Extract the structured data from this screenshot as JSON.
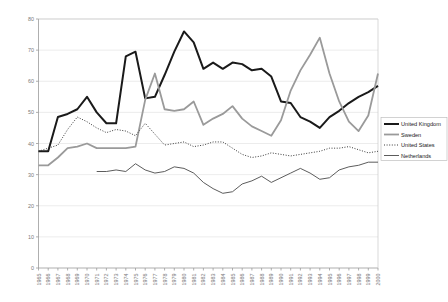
{
  "chart_data": {
    "type": "line",
    "title": "",
    "subtitle": "",
    "xlabel": "",
    "ylabel": "",
    "xlim": [
      1965,
      2000
    ],
    "ylim": [
      0,
      80
    ],
    "ytick_interval": 10,
    "grid": "horizontal",
    "legend_position": "right",
    "x": [
      1965,
      1966,
      1967,
      1968,
      1969,
      1970,
      1971,
      1972,
      1973,
      1974,
      1975,
      1976,
      1977,
      1978,
      1979,
      1980,
      1981,
      1982,
      1983,
      1984,
      1985,
      1986,
      1987,
      1988,
      1989,
      1990,
      1991,
      1992,
      1993,
      1994,
      1995,
      1996,
      1997,
      1998,
      1999,
      2000
    ],
    "yticks": [
      0,
      10,
      20,
      30,
      40,
      50,
      60,
      70,
      80
    ],
    "xtick_labels": [
      "1965",
      "1966",
      "1967",
      "1968",
      "1969",
      "1970",
      "1971",
      "1972",
      "1973",
      "1974",
      "1975",
      "1976",
      "1977",
      "1978",
      "1979",
      "1980",
      "1981",
      "1982",
      "1983",
      "1984",
      "1985",
      "1986",
      "1987",
      "1988",
      "1989",
      "1990",
      "1991",
      "1992",
      "1993",
      "1994",
      "1995",
      "1996",
      "1997",
      "1998",
      "1999",
      "2000"
    ],
    "series": [
      {
        "name": "United Kingdom",
        "color": "#1a1a1a",
        "width": 2.0,
        "dash": "none",
        "values": [
          37.5,
          37.5,
          48.5,
          49.5,
          51.0,
          55.0,
          50.0,
          46.5,
          46.5,
          68.0,
          69.5,
          54.5,
          55.0,
          62.0,
          69.5,
          76.0,
          72.5,
          64.0,
          66.0,
          64.0,
          66.0,
          65.5,
          63.5,
          64.0,
          61.5,
          53.5,
          53.0,
          48.5,
          47.0,
          45.0,
          48.5,
          50.5,
          53.0,
          55.0,
          56.5,
          58.5
        ]
      },
      {
        "name": "Sweden",
        "color": "#9a9a9a",
        "width": 1.8,
        "dash": "none",
        "values": [
          33.0,
          33.0,
          35.5,
          38.5,
          39.0,
          40.0,
          38.5,
          38.5,
          38.5,
          38.5,
          39.0,
          54.0,
          62.5,
          51.0,
          50.5,
          51.0,
          53.5,
          46.0,
          48.0,
          49.5,
          52.0,
          48.0,
          45.5,
          44.0,
          42.5,
          47.5,
          57.0,
          63.5,
          68.5,
          74.0,
          62.5,
          53.5,
          47.0,
          44.0,
          49.0,
          62.5
        ]
      },
      {
        "name": "United States",
        "color": "#3a3a3a",
        "width": 1.0,
        "dash": "1,1.6",
        "values": [
          37.5,
          38.5,
          39.5,
          44.5,
          48.5,
          47.0,
          45.0,
          43.5,
          44.5,
          44.0,
          42.5,
          46.5,
          43.0,
          39.5,
          40.0,
          40.5,
          39.0,
          39.5,
          40.5,
          40.5,
          38.5,
          36.5,
          35.5,
          36.0,
          37.0,
          36.5,
          36.0,
          36.5,
          37.0,
          37.5,
          38.5,
          38.5,
          39.0,
          38.0,
          37.0,
          37.5
        ]
      },
      {
        "name": "Netherlands",
        "color": "#4a4a4a",
        "width": 0.9,
        "dash": "none",
        "values": [
          null,
          null,
          null,
          null,
          null,
          null,
          31.0,
          31.0,
          31.5,
          31.0,
          33.5,
          31.5,
          30.5,
          31.0,
          32.5,
          32.0,
          30.5,
          27.5,
          25.5,
          24.0,
          24.5,
          27.0,
          28.0,
          29.5,
          27.5,
          29.0,
          30.5,
          32.0,
          30.5,
          28.5,
          29.0,
          31.5,
          32.5,
          33.0,
          34.0,
          34.0
        ]
      }
    ]
  },
  "legend": {
    "entries": [
      {
        "label": "United Kingdom"
      },
      {
        "label": "Sweden"
      },
      {
        "label": "United States"
      },
      {
        "label": "Netherlands"
      }
    ]
  }
}
